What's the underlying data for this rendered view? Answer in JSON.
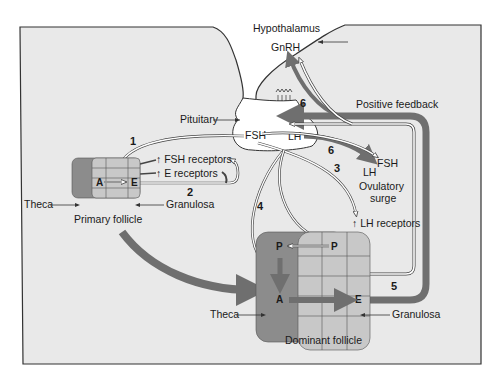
{
  "figure": {
    "colors": {
      "panel_bg": "#e9e9e9",
      "border": "#333333",
      "theca": "#8c8c8c",
      "granulosa": "#c8c8c8",
      "arrow_dark": "#6f6f6f",
      "arrow_outline": "#ffffff"
    },
    "labels": {
      "hypothalamus": "Hypothalamus",
      "gnrh": "GnRH",
      "pituitary": "Pituitary",
      "fsh": "FSH",
      "lh": "LH",
      "positive_feedback": "Positive feedback",
      "surge_lh": "LH",
      "surge_fsh": "FSH",
      "ovulatory": "Ovulatory",
      "surge": "surge",
      "fsh_receptors": "↑ FSH receptors",
      "e_receptors": "↑ E receptors",
      "lh_receptors": "↑ LH receptors",
      "theca_primary": "Theca",
      "granulosa_primary": "Granulosa",
      "primary_follicle": "Primary follicle",
      "theca_dominant": "Theca",
      "granulosa_dominant": "Granulosa",
      "dominant_follicle": "Dominant follicle"
    },
    "cells": {
      "primary_a": "A",
      "primary_e": "E",
      "dominant_p_theca": "P",
      "dominant_p_granulosa": "P",
      "dominant_a": "A",
      "dominant_e": "E"
    },
    "steps": [
      "1",
      "2",
      "3",
      "4",
      "5",
      "6",
      "6"
    ]
  }
}
